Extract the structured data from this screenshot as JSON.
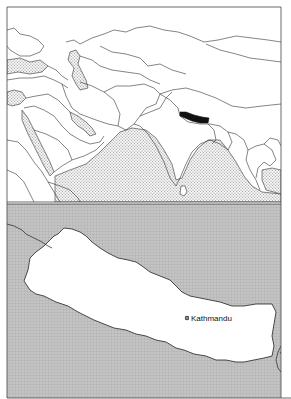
{
  "figure": {
    "panels": [
      {
        "id": "overview",
        "description": "Regional locator map of Middle East, Central and South Asia",
        "highlighted_country": "Nepal",
        "colors": {
          "land": "#ffffff",
          "sea": "#d9d9d9",
          "border": "#333333",
          "highlight": "#111111"
        }
      },
      {
        "id": "detail",
        "description": "Detail map of Nepal",
        "colors": {
          "country": "#ffffff",
          "surrounding": "#b8b8b8",
          "border": "#222222"
        },
        "cities": [
          {
            "name": "Kathmandu",
            "marker": "capital-icon"
          }
        ]
      }
    ]
  }
}
